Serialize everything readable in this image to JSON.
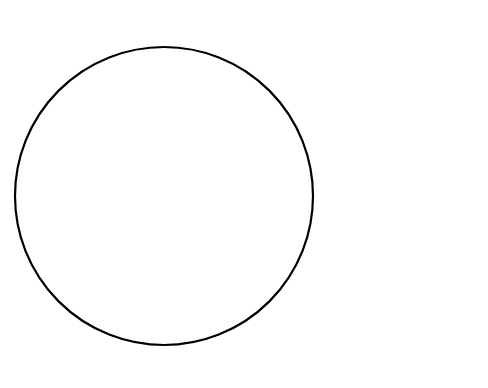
{
  "chart_data": {
    "type": "pie",
    "title": "",
    "total": 3861,
    "start_angle_deg": 0,
    "direction": "clockwise",
    "legend_position": "right",
    "categories": [
      "Food staple",
      "Food snack",
      "Food sauce",
      "Condiment",
      "Beverage",
      "Medicine",
      "Insecticide",
      "Fuelwood",
      "Structural",
      "Other"
    ],
    "values": [
      252,
      651,
      673,
      45,
      355,
      124,
      8,
      1058,
      695,
      0
    ],
    "percents": [
      6.6,
      16.9,
      17.5,
      1.2,
      9.2,
      3.2,
      0.2,
      27.4,
      18.1,
      0
    ],
    "slices": [
      {
        "name": "Insecticide",
        "value": 8,
        "percent": 0.2,
        "value_label": "8",
        "percent_label": "0.2%",
        "pattern": "white"
      },
      {
        "name": "Food staple",
        "value": 252,
        "percent": 6.6,
        "value_label": "252",
        "percent_label": "6.6%",
        "pattern": "black"
      },
      {
        "name": "Food snack",
        "value": 651,
        "percent": 16.9,
        "value_label": "651",
        "percent_label": "16.9%",
        "pattern": "diag-forward"
      },
      {
        "name": "Food sauce",
        "value": 673,
        "percent": 17.5,
        "value_label": "673",
        "percent_label": "17.5%",
        "pattern": "solid-gray"
      },
      {
        "name": "Condiment",
        "value": 45,
        "percent": 1.2,
        "value_label": "45",
        "percent_label": "1.2%",
        "pattern": "diag-back"
      },
      {
        "name": "Beverage",
        "value": 355,
        "percent": 9.2,
        "value_label": "355",
        "percent_label": "9.2%",
        "pattern": "dots-sparse"
      },
      {
        "name": "Medicine",
        "value": 124,
        "percent": 3.2,
        "value_label": "124",
        "percent_label": "3.2%",
        "pattern": "dark-gray"
      },
      {
        "name": "Fuelwood",
        "value": 1058,
        "percent": 27.4,
        "value_label": "1058",
        "percent_label": "27.4%",
        "pattern": "dots-dense"
      },
      {
        "name": "Structural",
        "value": 695,
        "percent": 18.1,
        "value_label": "695",
        "percent_label": "18.1%",
        "pattern": "grid"
      }
    ]
  },
  "legend": {
    "items": [
      {
        "label": "Food staple",
        "pattern": "black"
      },
      {
        "label": "Food snack",
        "pattern": "diag-forward"
      },
      {
        "label": "Food sauce",
        "pattern": "solid-gray"
      },
      {
        "label": "Condiment",
        "pattern": "diag-back"
      },
      {
        "label": "Beverage",
        "pattern": "dots-sparse"
      },
      {
        "label": "Medicine",
        "pattern": "dark-gray"
      },
      {
        "label": "Insecticide",
        "pattern": "white"
      },
      {
        "label": "Fuelwood",
        "pattern": "dots-dense"
      },
      {
        "label": "Structural",
        "pattern": "grid"
      },
      {
        "label": "Other",
        "pattern": "white"
      }
    ]
  },
  "colors": {
    "outline": "#000000",
    "text": "#111111",
    "black_fill": "#111111",
    "gray_fill": "#a9a9a9",
    "dark_gray_fill": "#5e5e5e",
    "white_fill": "#ffffff",
    "background": "#ffffff"
  },
  "geometry": {
    "center_x": 164,
    "center_y": 196,
    "radius": 149
  }
}
